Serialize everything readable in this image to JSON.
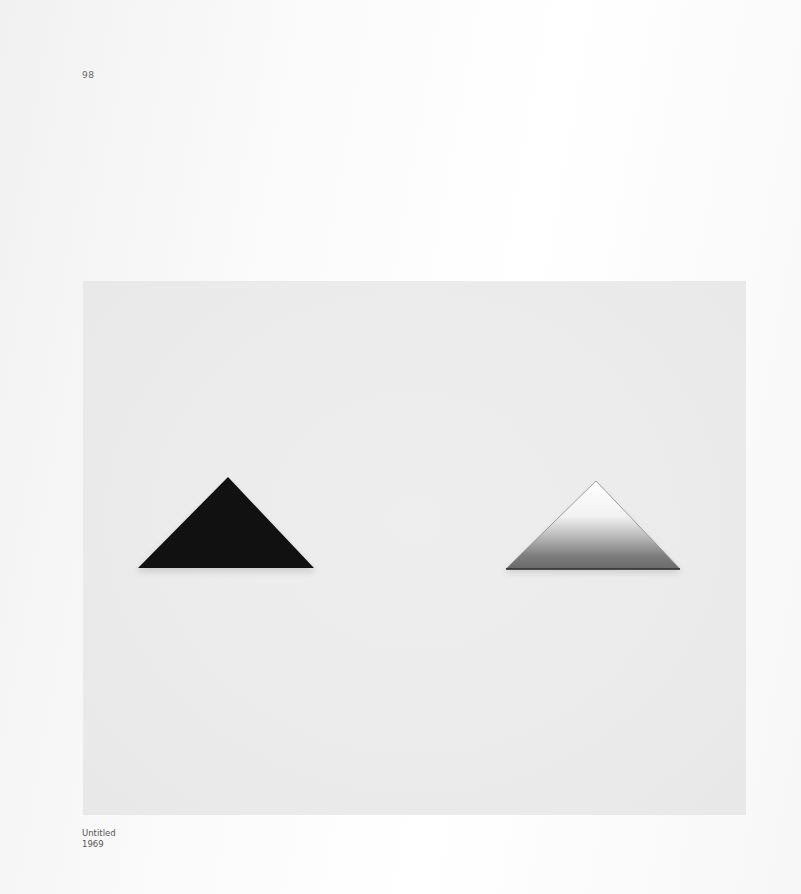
{
  "page": {
    "number": "98"
  },
  "plate": {
    "description": "Photograph of two triangular objects on a light gray wall",
    "background_color": "#ececec",
    "objects": [
      {
        "name": "dark-triangle",
        "fill": "#111111",
        "apex": [
          145,
          196
        ],
        "base_left": [
          55,
          287
        ],
        "base_right": [
          231,
          287
        ]
      },
      {
        "name": "mirror-triangle",
        "fill_top": "#ffffff",
        "fill_bottom": "#6e6e6e",
        "apex": [
          513,
          200
        ],
        "base_left": [
          423,
          288
        ],
        "base_right": [
          597,
          288
        ]
      }
    ]
  },
  "caption": {
    "title": "Untitled",
    "year": "1969"
  }
}
